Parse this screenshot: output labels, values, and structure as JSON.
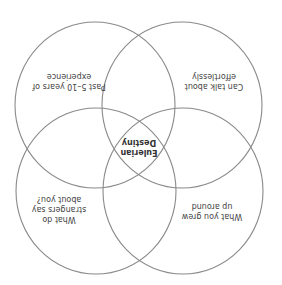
{
  "diagram": {
    "type": "venn",
    "orientation": "rotated-180",
    "stroke_color": "#8a8a8a",
    "text_color": "#444444",
    "circles": [
      {
        "id": "top-left",
        "label_lines": [
          "Past 5–10 years of",
          "experience"
        ]
      },
      {
        "id": "top-right",
        "label_lines": [
          "Can talk about",
          "effortlessly"
        ]
      },
      {
        "id": "bottom-left",
        "label_lines": [
          "What do",
          "strangers say",
          "about you?"
        ]
      },
      {
        "id": "bottom-right",
        "label_lines": [
          "What you grew",
          "up around"
        ]
      }
    ],
    "center": {
      "label_lines": [
        "Eulerian",
        "Destiny"
      ]
    }
  }
}
